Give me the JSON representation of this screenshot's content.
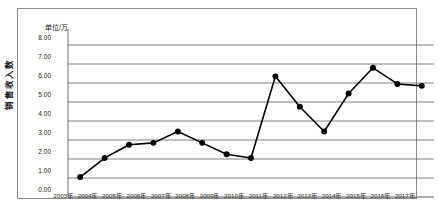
{
  "chart_data": {
    "type": "line",
    "title": "",
    "unit_label": "单位/万",
    "xlabel": "",
    "ylabel": "销售收入数",
    "categories": [
      "2003年",
      "2004年",
      "2005年",
      "2006年",
      "2007年",
      "2008年",
      "2009年",
      "2010年",
      "2011年",
      "2012年",
      "2013年",
      "2014年",
      "2015年",
      "2016年",
      "2017年"
    ],
    "values": [
      1.05,
      2.05,
      2.75,
      2.85,
      3.45,
      2.85,
      2.25,
      2.05,
      6.35,
      4.75,
      3.45,
      5.45,
      6.8,
      5.95,
      5.85
    ],
    "ylim": [
      0,
      8
    ],
    "ytick_step": 1,
    "ytick_labels": [
      "0.00",
      "1.00",
      "2.00",
      "3.00",
      "4.00",
      "5.00",
      "6.00",
      "7.00",
      "8.00"
    ],
    "grid": true,
    "grid_axis": "y",
    "legend": false,
    "legend_position": "none",
    "series_color": "#000000",
    "marker": "filled-circle",
    "marker_size": 4,
    "line_width": 1.6
  },
  "figure": {
    "border_color": "#8a8a8a",
    "background": "#ffffff",
    "caption": ""
  }
}
